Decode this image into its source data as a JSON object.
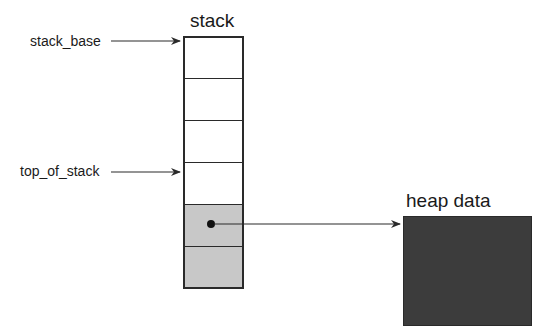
{
  "stack": {
    "title": "stack",
    "cells": [
      {
        "index": 0,
        "shaded": false
      },
      {
        "index": 1,
        "shaded": false
      },
      {
        "index": 2,
        "shaded": false
      },
      {
        "index": 3,
        "shaded": false
      },
      {
        "index": 4,
        "shaded": true,
        "has_pointer": true
      },
      {
        "index": 5,
        "shaded": true
      }
    ]
  },
  "pointers": {
    "stack_base": "stack_base",
    "top_of_stack": "top_of_stack"
  },
  "heap": {
    "title": "heap data"
  },
  "colors": {
    "line": "#2a2a2a",
    "shaded_cell": "#c8c8c8",
    "heap_fill": "#3c3c3c"
  }
}
